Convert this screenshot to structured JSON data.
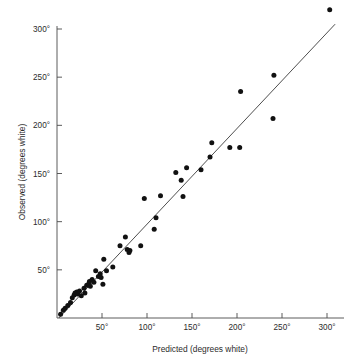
{
  "chart_data": {
    "type": "scatter",
    "title": "",
    "xlabel": "Predicted (degrees white)",
    "ylabel": "Observed (degrees white)",
    "xlim": [
      0,
      315
    ],
    "ylim": [
      0,
      330
    ],
    "grid": false,
    "legend": null,
    "x_ticks": [
      50,
      100,
      150,
      200,
      250,
      300
    ],
    "y_ticks": [
      50,
      100,
      150,
      200,
      250,
      300
    ],
    "x_tick_labels": [
      "50°",
      "100°",
      "150°",
      "200°",
      "250°",
      "300°"
    ],
    "y_tick_labels": [
      "50°",
      "100°",
      "150°",
      "200°",
      "250°",
      "300°"
    ],
    "reference_line": {
      "name": "identity-line",
      "x0": 2,
      "y0": 0,
      "x1": 309,
      "y1": 305
    },
    "series": [
      {
        "name": "observed-vs-predicted",
        "marker": "filled-circle",
        "color": "#111111",
        "points": [
          [
            4,
            4
          ],
          [
            7,
            8
          ],
          [
            9,
            10
          ],
          [
            12,
            13
          ],
          [
            15,
            16
          ],
          [
            17,
            21
          ],
          [
            19,
            24
          ],
          [
            20,
            26
          ],
          [
            22,
            27
          ],
          [
            23,
            25
          ],
          [
            25,
            28
          ],
          [
            27,
            23
          ],
          [
            30,
            31
          ],
          [
            31,
            26
          ],
          [
            33,
            34
          ],
          [
            35,
            35
          ],
          [
            36,
            38
          ],
          [
            37,
            33
          ],
          [
            39,
            40
          ],
          [
            41,
            37
          ],
          [
            43,
            49
          ],
          [
            46,
            43
          ],
          [
            48,
            46
          ],
          [
            49,
            42
          ],
          [
            51,
            35
          ],
          [
            52,
            61
          ],
          [
            55,
            49
          ],
          [
            62,
            53
          ],
          [
            70,
            75
          ],
          [
            76,
            84
          ],
          [
            78,
            71
          ],
          [
            80,
            68
          ],
          [
            81,
            70
          ],
          [
            93,
            75
          ],
          [
            97,
            124
          ],
          [
            108,
            92
          ],
          [
            110,
            104
          ],
          [
            115,
            127
          ],
          [
            132,
            151
          ],
          [
            138,
            143
          ],
          [
            140,
            126
          ],
          [
            144,
            156
          ],
          [
            160,
            154
          ],
          [
            170,
            167
          ],
          [
            172,
            182
          ],
          [
            192,
            177
          ],
          [
            203,
            177
          ],
          [
            204,
            235
          ],
          [
            240,
            207
          ],
          [
            241,
            252
          ],
          [
            303,
            320
          ]
        ]
      }
    ]
  },
  "axes": {
    "x_axis_name": "x-axis",
    "y_axis_name": "y-axis"
  }
}
